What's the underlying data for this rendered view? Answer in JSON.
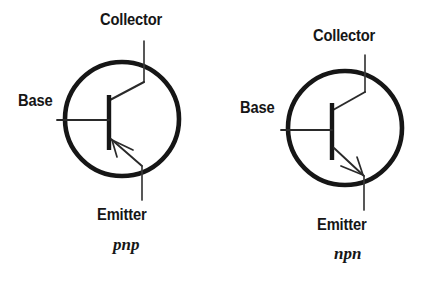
{
  "figure": {
    "background_color": "#ffffff",
    "ink_color": "#161616"
  },
  "symbols": [
    {
      "id": "pnp",
      "type_label": "pnp",
      "arrow_direction": "inward",
      "terminals": {
        "collector": "Collector",
        "base": "Base",
        "emitter": "Emitter"
      }
    },
    {
      "id": "npn",
      "type_label": "npn",
      "arrow_direction": "outward",
      "terminals": {
        "collector": "Collector",
        "base": "Base",
        "emitter": "Emitter"
      }
    }
  ]
}
